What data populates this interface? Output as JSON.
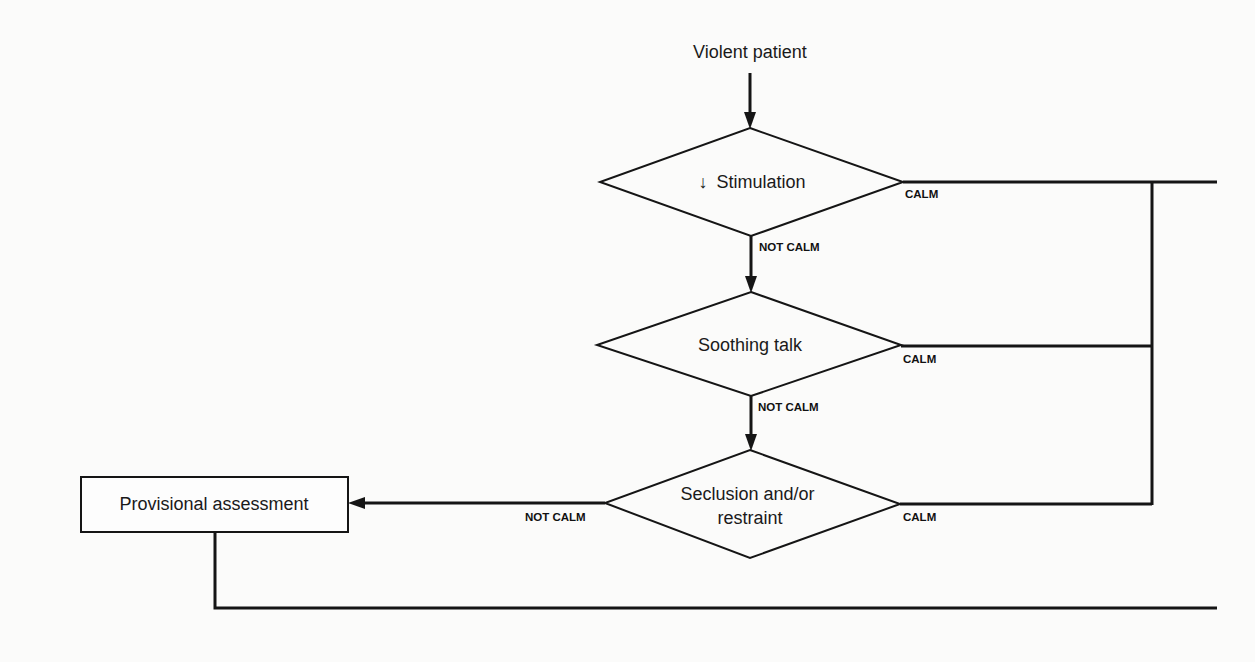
{
  "diagram": {
    "type": "flowchart",
    "start": {
      "label": "Violent patient"
    },
    "nodes": [
      {
        "id": "stimulation",
        "shape": "diamond",
        "icon": "down-arrow-icon",
        "icon_glyph": "↓",
        "label": "Stimulation",
        "full_label": "↓ Stimulation"
      },
      {
        "id": "soothing-talk",
        "shape": "diamond",
        "label": "Soothing talk"
      },
      {
        "id": "seclusion",
        "shape": "diamond",
        "label_line1": "Seclusion and/or",
        "label_line2": "restraint"
      },
      {
        "id": "provisional-assessment",
        "shape": "rectangle",
        "label": "Provisional assessment"
      }
    ],
    "edges": [
      {
        "from": "start",
        "to": "stimulation",
        "label": ""
      },
      {
        "from": "stimulation",
        "to": "soothing-talk",
        "label": "NOT CALM"
      },
      {
        "from": "stimulation",
        "to": "exit-right",
        "label": "CALM"
      },
      {
        "from": "soothing-talk",
        "to": "seclusion",
        "label": "NOT CALM"
      },
      {
        "from": "soothing-talk",
        "to": "exit-right",
        "label": "CALM"
      },
      {
        "from": "seclusion",
        "to": "provisional-assessment",
        "label": "NOT CALM"
      },
      {
        "from": "seclusion",
        "to": "exit-right",
        "label": "CALM"
      },
      {
        "from": "provisional-assessment",
        "to": "exit-right-bottom",
        "label": ""
      }
    ],
    "labels": {
      "calm": "CALM",
      "not_calm": "NOT CALM"
    },
    "colors": {
      "background": "#fbfbfa",
      "ink": "#151515"
    }
  }
}
